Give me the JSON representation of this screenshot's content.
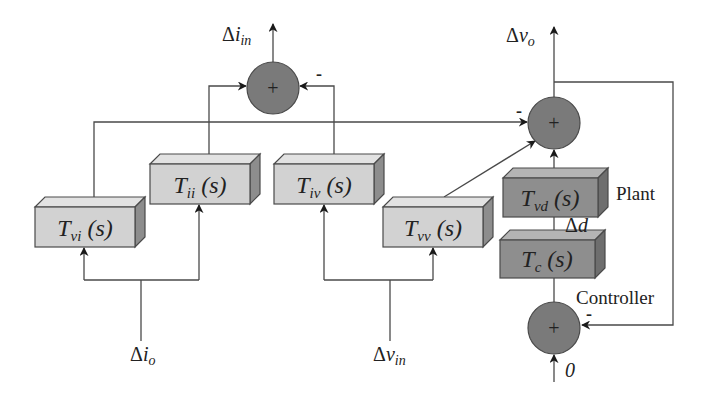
{
  "diagram": {
    "type": "block-diagram",
    "colors": {
      "wire": "#4a4a4a",
      "light_block": "#d2d2d2",
      "dark_block": "#8e8e8e",
      "junction": "#7a7a7a"
    },
    "blocks": [
      {
        "id": "tvi",
        "name": "T",
        "sub": "vi",
        "arg": " (s)",
        "shade": "light"
      },
      {
        "id": "tii",
        "name": "T",
        "sub": "ii",
        "arg": " (s)",
        "shade": "light"
      },
      {
        "id": "tiv",
        "name": "T",
        "sub": "iv",
        "arg": " (s)",
        "shade": "light"
      },
      {
        "id": "tvv",
        "name": "T",
        "sub": "vv",
        "arg": " (s)",
        "shade": "light"
      },
      {
        "id": "tvd",
        "name": "T",
        "sub": "vd",
        "arg": " (s)",
        "shade": "dark"
      },
      {
        "id": "tc",
        "name": "T",
        "sub": "c",
        "arg": " (s)",
        "shade": "dark"
      }
    ],
    "junctions": [
      {
        "id": "sum_iin",
        "symbol": "+",
        "minus_label": "-"
      },
      {
        "id": "sum_vo",
        "symbol": "+",
        "minus_label": "-"
      },
      {
        "id": "sum_ctrl",
        "symbol": "+",
        "minus_label": "-"
      }
    ],
    "signals": {
      "delta_iin": {
        "delta": "Δ",
        "var": "i",
        "sub": "in"
      },
      "delta_vo": {
        "delta": "Δ",
        "var": "v",
        "sub": "o"
      },
      "delta_io": {
        "delta": "Δ",
        "var": "i",
        "sub": "o"
      },
      "delta_vin": {
        "delta": "Δ",
        "var": "v",
        "sub": "in"
      },
      "delta_d": {
        "delta": "Δ",
        "var": "d"
      },
      "zero": "0"
    },
    "annotations": {
      "plant": "Plant",
      "controller": "Controller"
    }
  }
}
